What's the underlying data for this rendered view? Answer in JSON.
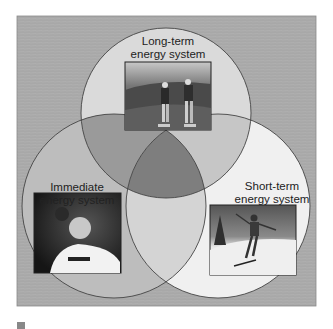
{
  "figure": {
    "panel_color": "#a9a9a9",
    "circles": [
      {
        "id": "long-term",
        "label_line1": "Long-term",
        "label_line2": "energy system",
        "fill": "#dadada",
        "photo": "roller-skaters"
      },
      {
        "id": "immediate",
        "label_line1": "Immediate",
        "label_line2": "energy system",
        "fill": "#bdbdbd",
        "photo": "shot-putter"
      },
      {
        "id": "short-term",
        "label_line1": "Short-term",
        "label_line2": "energy system",
        "fill": "#f0f0f0",
        "photo": "skier"
      }
    ],
    "overlap_colors": {
      "long_immediate": "#9a9a9a",
      "long_short": "#c6c6c6",
      "immediate_short": "#d4d4d4",
      "all_three": "#7e7e7e"
    }
  }
}
